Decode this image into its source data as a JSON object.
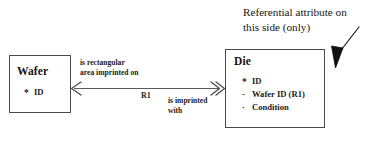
{
  "diagram": {
    "type": "entity-relationship",
    "entities": [
      {
        "name": "Wafer",
        "title": "Wafer",
        "attributes": [
          {
            "marker": "*",
            "marker_kind": "star",
            "label": "ID"
          }
        ]
      },
      {
        "name": "Die",
        "title": "Die",
        "attributes": [
          {
            "marker": "*",
            "marker_kind": "star",
            "label": "ID"
          },
          {
            "marker": "-",
            "marker_kind": "dash",
            "label": "Wafer ID (R1)"
          },
          {
            "marker": "·",
            "marker_kind": "dot",
            "label": "Condition"
          }
        ]
      }
    ],
    "relationship": {
      "id_label": "R1",
      "forward_phrase_line1": "is rectangular",
      "forward_phrase_line2": "area imprinted on",
      "reverse_phrase_line1": "is imprinted",
      "reverse_phrase_line2": "with",
      "left_multiplicity": "one",
      "right_multiplicity": "many",
      "left_arrow_icon": "single-arrowhead-icon",
      "right_arrow_icon": "double-arrowhead-icon"
    },
    "annotation": {
      "line1": "Referential attribute on",
      "line2": "this side (only)",
      "arrow_icon": "callout-arrow-icon",
      "arrow_target": "Die"
    },
    "colors": {
      "background": "#ffffff",
      "box_border": "#4a4a4a",
      "line": "#5a5a5a",
      "text": "#1a1a1a",
      "arrowhead_fill": "#111111"
    }
  }
}
